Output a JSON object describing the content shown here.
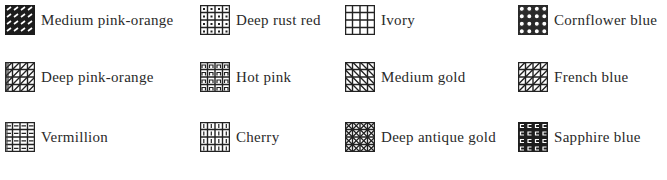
{
  "legend": {
    "items": [
      {
        "label": "Medium pink-orange",
        "pattern": "diagonal-dash"
      },
      {
        "label": "Deep rust red",
        "pattern": "dotted-grid"
      },
      {
        "label": "Ivory",
        "pattern": "plain-grid"
      },
      {
        "label": "Cornflower blue",
        "pattern": "circle-grid"
      },
      {
        "label": "Deep pink-orange",
        "pattern": "grid-diagonal-hatch"
      },
      {
        "label": "Hot pink",
        "pattern": "arch-grid"
      },
      {
        "label": "Medium gold",
        "pattern": "grid-diagonal"
      },
      {
        "label": "French blue",
        "pattern": "grid-antidiagonal"
      },
      {
        "label": "Vermillion",
        "pattern": "dash-grid"
      },
      {
        "label": "Cherry",
        "pattern": "bar-grid"
      },
      {
        "label": "Deep antique gold",
        "pattern": "cross-hatch-dense"
      },
      {
        "label": "Sapphire blue",
        "pattern": "meander-grid"
      }
    ]
  }
}
